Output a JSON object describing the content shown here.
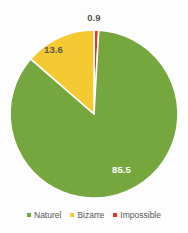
{
  "chart_data": {
    "type": "pie",
    "title": "",
    "categories": [
      "Naturel",
      "Bizarre",
      "Impossible"
    ],
    "values": [
      85.5,
      13.6,
      0.9
    ],
    "value_labels": [
      "85.5",
      "13.6",
      "0.9"
    ],
    "colors": [
      "#76a73e",
      "#f5c932",
      "#e8312b"
    ],
    "legend_position": "bottom",
    "grid": false,
    "start_angle_deg": 0,
    "direction": "clockwise",
    "slice_order": [
      "Impossible",
      "Naturel",
      "Bizarre"
    ],
    "separator_color": "#ffffff",
    "background_color": "#fdfdfd"
  },
  "labels": {
    "impossible": "0.9",
    "bizarre": "13.6",
    "naturel": "85.5"
  },
  "legend": {
    "items": [
      {
        "label": "Naturel",
        "color": "#76a73e"
      },
      {
        "label": "Bizarre",
        "color": "#f5c932"
      },
      {
        "label": "Impossible",
        "color": "#e8312b"
      }
    ]
  }
}
